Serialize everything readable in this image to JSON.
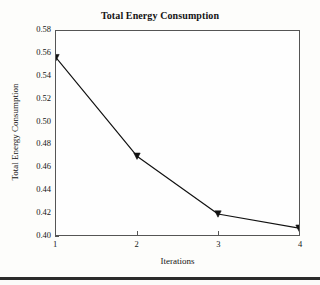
{
  "chart_data": {
    "type": "line",
    "title": "Total Energy Consumption",
    "xlabel": "Iterations",
    "ylabel": "Total Energy Consumption",
    "x": [
      1,
      2,
      3,
      4
    ],
    "values": [
      0.5565,
      0.4695,
      0.4185,
      0.406
    ],
    "series": [
      {
        "name": "Total Energy Consumption",
        "values": [
          0.5565,
          0.4695,
          0.4185,
          0.406
        ]
      }
    ],
    "xlim": [
      1,
      4
    ],
    "ylim": [
      0.4,
      0.58
    ],
    "xticks": [
      "1",
      "2",
      "3",
      "4"
    ],
    "yticks": [
      "0.40",
      "0.42",
      "0.44",
      "0.46",
      "0.48",
      "0.50",
      "0.52",
      "0.54",
      "0.56",
      "0.58"
    ],
    "ytick_values": [
      0.4,
      0.42,
      0.44,
      0.46,
      0.48,
      0.5,
      0.52,
      0.54,
      0.56,
      0.58
    ],
    "grid": false,
    "legend": "none",
    "marker": "triangle",
    "line_color": "#111111",
    "marker_color": "#111111",
    "background_color": "#fdfdfb"
  }
}
